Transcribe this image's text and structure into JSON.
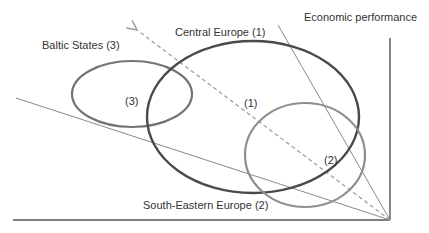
{
  "diagram": {
    "axis_label": "Economic performance",
    "groups": [
      {
        "id": 1,
        "name": "Central Europe (1)",
        "marker": "(1)",
        "color": "#4a4a4a"
      },
      {
        "id": 2,
        "name": "South-Eastern Europe (2)",
        "marker": "(2)",
        "color": "#8e8e8e"
      },
      {
        "id": 3,
        "name": "Baltic States (3)",
        "marker": "(3)",
        "color": "#747474"
      }
    ],
    "colors": {
      "axis": "#555555",
      "thin_line": "#8a8a8a",
      "dashed_arrow": "#9a9a9a",
      "text": "#333333"
    }
  }
}
